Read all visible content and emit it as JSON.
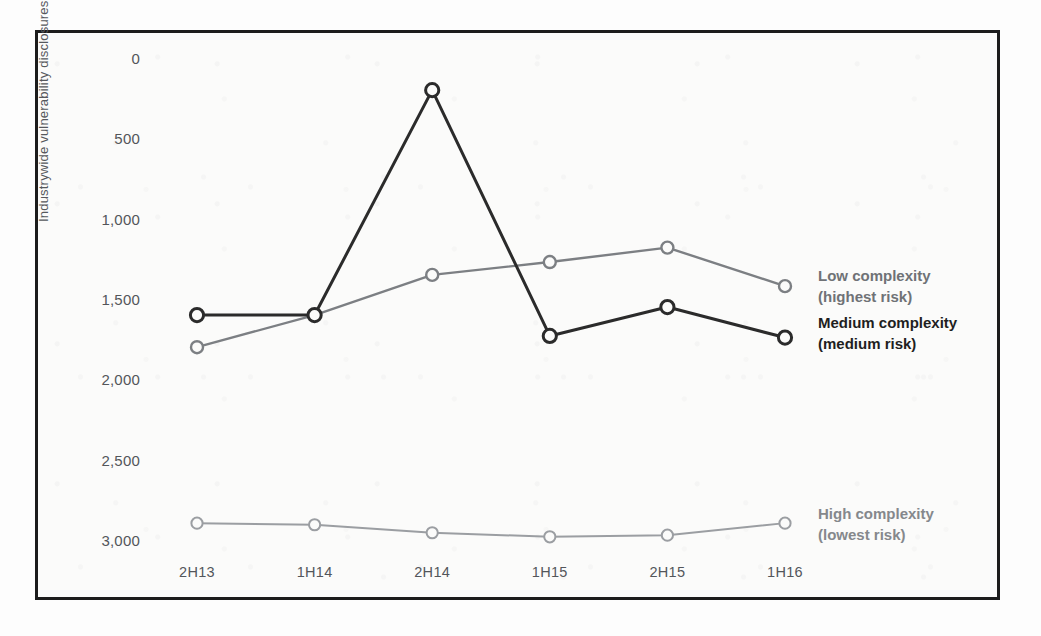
{
  "figure": {
    "background_color": "#fbfbfa",
    "frame_color": "#1c1c1c"
  },
  "axes": {
    "y_title": "Industrywide vulnerability disclosures",
    "y_ticks": [
      "3,000",
      "2,500",
      "2,000",
      "1,500",
      "1,000",
      "500",
      "0"
    ],
    "x_ticks": [
      "2H13",
      "1H14",
      "2H14",
      "1H15",
      "2H15",
      "1H16"
    ]
  },
  "annotations": {
    "low": {
      "line1": "Low complexity",
      "line2": "(highest risk)",
      "color": "#6f7276"
    },
    "medium": {
      "line1": "Medium complexity",
      "line2": "(medium risk)",
      "color": "#1f1f1f"
    },
    "high": {
      "line1": "High complexity",
      "line2": "(lowest risk)",
      "color": "#85888c"
    }
  },
  "chart_data": {
    "type": "line",
    "title": "",
    "xlabel": "",
    "ylabel": "Industrywide vulnerability disclosures",
    "categories": [
      "2H13",
      "1H14",
      "2H14",
      "1H15",
      "2H15",
      "1H16"
    ],
    "ylim": [
      0,
      3000
    ],
    "ytick_values": [
      0,
      500,
      1000,
      1500,
      2000,
      2500,
      3000
    ],
    "grid": false,
    "legend_position": "inline-right",
    "series": [
      {
        "name": "Low complexity (highest risk)",
        "color": "#7c7f83",
        "marker": "open-circle",
        "values": [
          1200,
          1400,
          1650,
          1730,
          1820,
          1580
        ]
      },
      {
        "name": "Medium complexity (medium risk)",
        "color": "#2b2b2b",
        "marker": "open-circle",
        "values": [
          1400,
          1400,
          2800,
          1270,
          1450,
          1260
        ]
      },
      {
        "name": "High complexity (lowest risk)",
        "color": "#9b9ea2",
        "marker": "open-circle",
        "values": [
          105,
          95,
          45,
          20,
          30,
          105
        ]
      }
    ]
  }
}
